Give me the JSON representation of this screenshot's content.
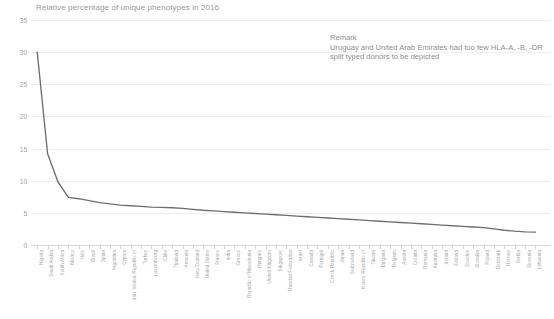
{
  "chart_data": {
    "type": "line",
    "title": "Relative percentage of unique phenotypes in 2016",
    "xlabel": "",
    "ylabel": "",
    "ylim": [
      0,
      35
    ],
    "ytick_labels": [
      "0",
      "5",
      "10",
      "15",
      "20",
      "25",
      "30",
      "35"
    ],
    "ytick_values": [
      0,
      5,
      10,
      15,
      20,
      25,
      30,
      35
    ],
    "grid": true,
    "legend_position": "none",
    "line_color": "#6e6e6e",
    "categories": [
      "Nigeria",
      "Saudi Arabia",
      "South Africa",
      "Mexico",
      "Italy",
      "Brazil",
      "Spain",
      "Argentina",
      "Cyprus",
      "Iran, Islamic Republic of",
      "Turkey",
      "Luxembourg",
      "Chile",
      "Thailand",
      "Armenia",
      "New Zealand",
      "United States",
      "France",
      "India",
      "Greece",
      "Republic of Macedonia",
      "Hungary",
      "United Kingdom",
      "Singapore",
      "Russian Federation",
      "Israel",
      "Canada",
      "Portugal",
      "Czech Republic",
      "Japan",
      "Switzerland",
      "Korea, Republic of",
      "Taiwan",
      "Bulgaria",
      "Belgium",
      "Austria",
      "Croatia",
      "Romania",
      "Australia",
      "Ireland",
      "Finland",
      "Sweden",
      "Slovakia",
      "Poland",
      "Denmark",
      "Norway",
      "Serbia",
      "Slovenia",
      "Lithuania"
    ],
    "values": [
      30.0,
      14.2,
      9.8,
      7.4,
      7.2,
      6.9,
      6.6,
      6.4,
      6.2,
      6.1,
      6.0,
      5.9,
      5.85,
      5.8,
      5.7,
      5.55,
      5.4,
      5.3,
      5.2,
      5.1,
      5.0,
      4.9,
      4.8,
      4.7,
      4.6,
      4.5,
      4.4,
      4.3,
      4.2,
      4.1,
      4.0,
      3.9,
      3.8,
      3.7,
      3.6,
      3.5,
      3.4,
      3.3,
      3.2,
      3.1,
      3.0,
      2.9,
      2.8,
      2.7,
      2.5,
      2.3,
      2.15,
      2.05,
      2.0
    ],
    "annotations": [
      {
        "name": "remark",
        "title": "Remark",
        "body": "Uruguay and United Arab Emirates had too few HLA-A, -B, -DR split typed donors to be depicted"
      }
    ]
  }
}
